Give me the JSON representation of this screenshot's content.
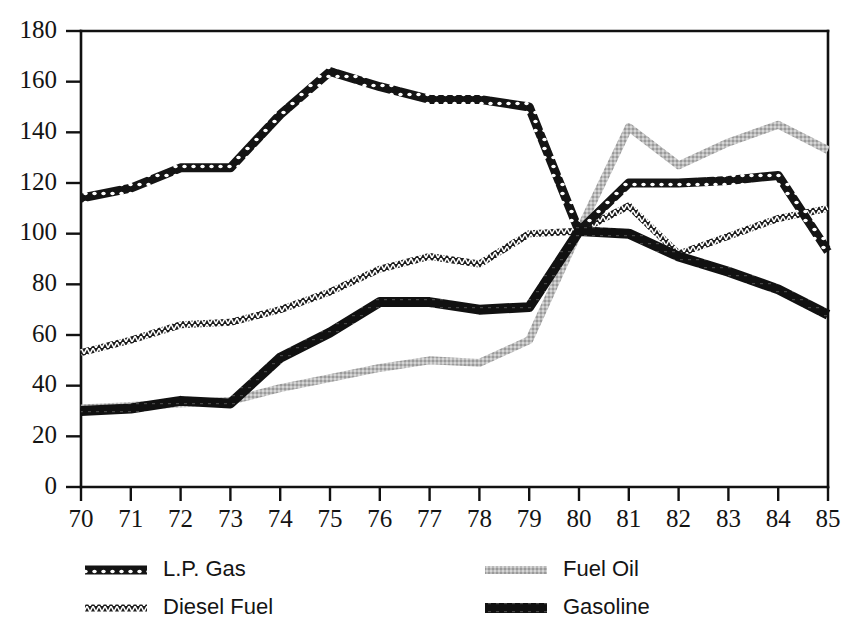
{
  "chart_data": {
    "type": "line",
    "title": "",
    "subtitle": "",
    "xlabel": "",
    "ylabel": "",
    "x": [
      70,
      71,
      72,
      73,
      74,
      75,
      76,
      77,
      78,
      79,
      80,
      81,
      82,
      83,
      84,
      85
    ],
    "categories": [
      "70",
      "71",
      "72",
      "73",
      "74",
      "75",
      "76",
      "77",
      "78",
      "79",
      "80",
      "81",
      "82",
      "83",
      "84",
      "85"
    ],
    "xlim": [
      70,
      85
    ],
    "ylim": [
      0,
      180
    ],
    "ytick_values": [
      0,
      20,
      40,
      60,
      80,
      100,
      120,
      140,
      160,
      180
    ],
    "ytick_labels": [
      "0",
      "20",
      "40",
      "60",
      "80",
      "100",
      "120",
      "140",
      "160",
      "180"
    ],
    "xtick_labels": [
      "70",
      "71",
      "72",
      "73",
      "74",
      "75",
      "76",
      "77",
      "78",
      "79",
      "80",
      "81",
      "82",
      "83",
      "84",
      "85"
    ],
    "grid": false,
    "legend_position": "below-plot",
    "series": [
      {
        "name": "L.P. Gas",
        "style": "bead-chain",
        "color": "#161616",
        "values": [
          114,
          118,
          126,
          126,
          147,
          164,
          158,
          153,
          153,
          150,
          101,
          120,
          120,
          121,
          123,
          93
        ]
      },
      {
        "name": "Diesel Fuel",
        "style": "zigzag-hatch",
        "color": "#1d1d1d",
        "values": [
          53,
          58,
          64,
          65,
          70,
          77,
          86,
          91,
          88,
          100,
          101,
          111,
          92,
          99,
          106,
          110
        ]
      },
      {
        "name": "Fuel Oil",
        "style": "light-gray",
        "color": "#b4b4b4",
        "values": [
          31,
          32,
          33,
          34,
          39,
          43,
          47,
          50,
          49,
          58,
          101,
          142,
          127,
          136,
          143,
          133
        ]
      },
      {
        "name": "Gasoline",
        "style": "thick-solid",
        "color": "#111111",
        "values": [
          30,
          31,
          34,
          33,
          51,
          61,
          73,
          73,
          70,
          71,
          101,
          100,
          91,
          85,
          78,
          68
        ]
      }
    ]
  },
  "legend": {
    "entries": [
      {
        "label": "L.P. Gas",
        "series": "L.P. Gas"
      },
      {
        "label": "Diesel Fuel",
        "series": "Diesel Fuel"
      },
      {
        "label": "Fuel Oil",
        "series": "Fuel Oil"
      },
      {
        "label": "Gasoline",
        "series": "Gasoline"
      }
    ]
  },
  "axes": {
    "y_min_label": "0",
    "y_max_label": "180",
    "x_min_label": "70",
    "x_max_label": "85"
  }
}
